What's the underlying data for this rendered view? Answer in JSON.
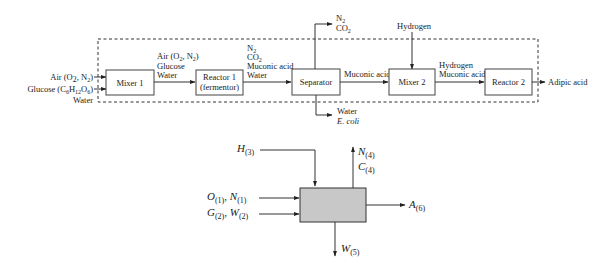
{
  "top_diagram": {
    "inputs": {
      "air": "Air (O",
      "air_o_sub": "2",
      "air_mid": ", N",
      "air_n_sub": "2",
      "air_end": ")",
      "glucose": "Glucose (C",
      "glucose_c_sub": "6",
      "glucose_h": "H",
      "glucose_h_sub": "12",
      "glucose_o": "O",
      "glucose_o_sub": "6",
      "glucose_end": ")",
      "water": "Water"
    },
    "units": {
      "mixer1": "Mixer 1",
      "reactor1_line1": "Reactor 1",
      "reactor1_line2": "(fermentor)",
      "separator": "Separator",
      "mixer2": "Mixer 2",
      "reactor2": "Reactor 2"
    },
    "streams": {
      "m1_r1": {
        "line1_a": "Air (O",
        "line1_sub1": "2",
        "line1_b": ", N",
        "line1_sub2": "2",
        "line1_c": ")",
        "line2": "Glucose",
        "line3": "Water"
      },
      "r1_sep": {
        "line1": "N",
        "line1_sub": "2",
        "line2": "CO",
        "line2_sub": "2",
        "line3": "Muconic acid",
        "line4": "Water"
      },
      "sep_top": {
        "line1": "N",
        "line1_sub": "2",
        "line2": "CO",
        "line2_sub": "2"
      },
      "sep_bottom": {
        "line1": "Water",
        "line2": "E. coli"
      },
      "sep_m2": "Muconic acid",
      "hydrogen_in": "Hydrogen",
      "m2_r2": {
        "line1": "Hydrogen",
        "line2": "Muconic acid"
      },
      "product": "Adipic acid"
    }
  },
  "bottom_diagram": {
    "h_in": {
      "var": "H",
      "sub": "(3)"
    },
    "on_in": {
      "var1": "O",
      "sub1": "(1)",
      "sep": ", ",
      "var2": "N",
      "sub2": "(1)"
    },
    "gw_in": {
      "var1": "G",
      "sub1": "(2)",
      "sep": ", ",
      "var2": "W",
      "sub2": "(2)"
    },
    "nc_out": {
      "n": "N",
      "n_sub": "(4)",
      "c": "C",
      "c_sub": "(4)"
    },
    "a_out": {
      "var": "A",
      "sub": "(6)"
    },
    "w_out": {
      "var": "W",
      "sub": "(5)"
    }
  }
}
